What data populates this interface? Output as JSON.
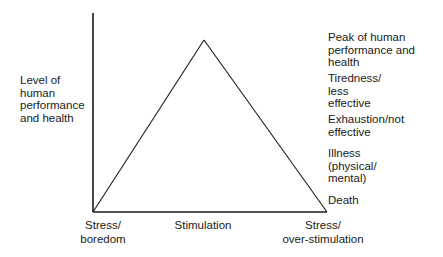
{
  "diagram": {
    "type": "performance-stress triangle",
    "y_axis_label": "Level of\nhuman\nperformance\nand health",
    "x_axis_labels": [
      {
        "text": "Stress/\nboredom"
      },
      {
        "text": "Stimulation"
      },
      {
        "text": "Stress/\nover-stimulation"
      }
    ],
    "right_labels": [
      {
        "text": "Peak of human\nperformance and\nhealth"
      },
      {
        "text": "Tiredness/\nless\neffective"
      },
      {
        "text": "Exhaustion/not\neffective"
      },
      {
        "text": "Illness\n(physical/\nmental)"
      },
      {
        "text": "Death"
      }
    ],
    "geometry": {
      "origin": [
        93,
        212
      ],
      "peak": [
        204,
        40
      ],
      "right_corner": [
        327,
        212
      ],
      "axis_top": 13
    },
    "colors": {
      "line": "#1a1a1a",
      "background": "#ffffff"
    }
  }
}
